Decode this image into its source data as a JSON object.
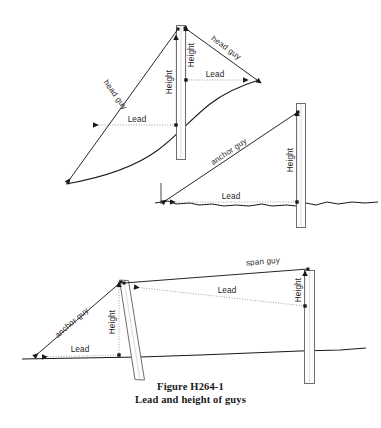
{
  "figure": {
    "caption_line1": "Figure H264-1",
    "caption_line2": "Lead and height of guys",
    "background_color": "#ffffff",
    "ink_color": "#1a1a1a"
  },
  "panels": {
    "top": {
      "name": "head-guy-panel",
      "left_guy_label": "head guy",
      "right_guy_label": "head guy",
      "left_height_label": "Height",
      "right_height_label": "Height",
      "left_lead_label": "Lead",
      "right_lead_label": "Lead"
    },
    "middle": {
      "name": "anchor-guy-panel",
      "guy_label": "anchor guy",
      "height_label": "Height",
      "lead_label": "Lead"
    },
    "bottom": {
      "name": "anchor-and-span-guy-panel",
      "anchor_guy_label": "anchor guy",
      "span_guy_label": "span guy",
      "left_height_label": "Height",
      "right_height_label": "Height",
      "left_lead_label": "Lead",
      "right_lead_label": "Lead"
    }
  }
}
